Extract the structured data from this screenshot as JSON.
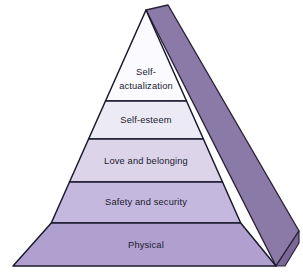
{
  "diagram": {
    "type": "pyramid",
    "background_color": "#ffffff",
    "outline_color": "#1a1a2e",
    "text_color": "#1a1a2e",
    "side_face_color": "#8b7aa8",
    "side_face_color_dark": "#7a6896",
    "tiers": [
      {
        "id": "tier-1",
        "label": "Self-actualization",
        "label_lines": [
          "Self-",
          "actualization"
        ],
        "fill_color": "#fbfaff",
        "level": 1,
        "position": "top"
      },
      {
        "id": "tier-2",
        "label": "Self-esteem",
        "label_lines": [
          "Self-esteem"
        ],
        "fill_color": "#eceaf5",
        "level": 2,
        "position": "upper-middle"
      },
      {
        "id": "tier-3",
        "label": "Love and belonging",
        "label_lines": [
          "Love and belonging"
        ],
        "fill_color": "#dcd5ea",
        "level": 3,
        "position": "middle"
      },
      {
        "id": "tier-4",
        "label": "Safety and security",
        "label_lines": [
          "Safety and security"
        ],
        "fill_color": "#c5b8de",
        "level": 4,
        "position": "lower-middle"
      },
      {
        "id": "tier-5",
        "label": "Physical",
        "label_lines": [
          "Physical"
        ],
        "fill_color": "#b0a0d0",
        "level": 5,
        "position": "base"
      }
    ]
  }
}
